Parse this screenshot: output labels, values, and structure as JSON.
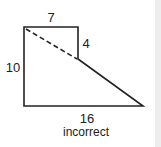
{
  "diagram": {
    "labels": {
      "top": "7",
      "right_short": "4",
      "left": "10",
      "bottom": "16",
      "caption": "incorrect"
    },
    "colors": {
      "stroke": "#222222",
      "side_bar": "#eeeeee"
    }
  }
}
